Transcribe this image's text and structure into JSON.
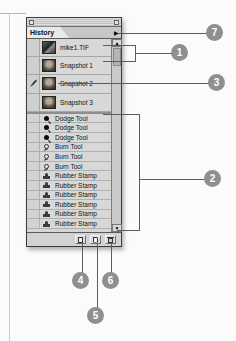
{
  "colors": {
    "callout_circle": "#8f8f8f",
    "callout_number": "#ffffff",
    "palette_bg": "#d2d2d2",
    "annotation_line": "#5c5c5c"
  },
  "window": {
    "tab_label": "History",
    "menu_arrow_glyph": "▶",
    "scroll_up_glyph": "▲",
    "scroll_down_glyph": "▼"
  },
  "snapshots": [
    {
      "label": "mike1.TIF",
      "icon": "image-thumbnail"
    },
    {
      "label": "Snapshot 1",
      "icon": "snapshot-thumbnail"
    },
    {
      "label": "Snapshot 2",
      "icon": "snapshot-thumbnail",
      "source_icon": "history-brush-source-icon"
    },
    {
      "label": "Snapshot 3",
      "icon": "snapshot-thumbnail"
    }
  ],
  "states": [
    {
      "tool": "Dodge Tool",
      "icon": "dodge-tool-icon"
    },
    {
      "tool": "Dodge Tool",
      "icon": "dodge-tool-icon"
    },
    {
      "tool": "Dodge Tool",
      "icon": "dodge-tool-icon"
    },
    {
      "tool": "Burn Tool",
      "icon": "burn-tool-icon"
    },
    {
      "tool": "Burn Tool",
      "icon": "burn-tool-icon"
    },
    {
      "tool": "Burn Tool",
      "icon": "burn-tool-icon"
    },
    {
      "tool": "Rubber Stamp",
      "icon": "rubber-stamp-icon"
    },
    {
      "tool": "Rubber Stamp",
      "icon": "rubber-stamp-icon"
    },
    {
      "tool": "Rubber Stamp",
      "icon": "rubber-stamp-icon"
    },
    {
      "tool": "Rubber Stamp",
      "icon": "rubber-stamp-icon"
    },
    {
      "tool": "Rubber Stamp",
      "icon": "rubber-stamp-icon"
    },
    {
      "tool": "Rubber Stamp",
      "icon": "rubber-stamp-icon"
    }
  ],
  "buttons": [
    {
      "name": "new-document-from-state",
      "icon": "new-document-icon"
    },
    {
      "name": "new-snapshot",
      "icon": "new-snapshot-icon"
    },
    {
      "name": "delete-state",
      "icon": "trash-icon"
    }
  ],
  "callouts": {
    "c1": "1",
    "c2": "2",
    "c3": "3",
    "c4": "4",
    "c5": "5",
    "c6": "6",
    "c7": "7"
  }
}
